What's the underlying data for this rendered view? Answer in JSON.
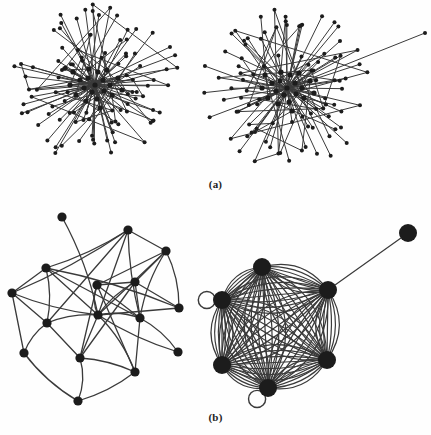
{
  "figure": {
    "background_color": "#fefefe",
    "edge_color": "#3a3a3a",
    "node_color": "#1c1c1c",
    "panels": [
      {
        "id": "a",
        "caption": "(a)",
        "description": "Two large star-like hub-and-spoke networks with many degree-one leaf nodes"
      },
      {
        "id": "b",
        "caption": "(b)",
        "description": "Left: sparse 14-node graph with one pendant node. Right: dense 6-node multigraph with parallel edges, two self-loops and one pendant node"
      }
    ]
  },
  "chart_data": {
    "type": "diagram",
    "subtype": "node-link-graph",
    "title": "",
    "graphs": [
      {
        "name": "panel-a-left",
        "panel": "a",
        "position": "left",
        "layout": "radial-hub",
        "node_count": 118,
        "hub_center": [
          95,
          85
        ],
        "hub_core_nodes": [
          [
            95,
            85
          ],
          [
            88,
            78
          ],
          [
            103,
            80
          ],
          [
            92,
            92
          ],
          [
            104,
            91
          ],
          [
            84,
            88
          ],
          [
            98,
            72
          ],
          [
            110,
            85
          ],
          [
            80,
            80
          ],
          [
            97,
            99
          ],
          [
            89,
            69
          ],
          [
            112,
            95
          ],
          [
            76,
            95
          ],
          [
            107,
            70
          ],
          [
            86,
            101
          ],
          [
            118,
            78
          ],
          [
            70,
            85
          ],
          [
            100,
            108
          ],
          [
            122,
            90
          ],
          [
            73,
            72
          ]
        ],
        "leaf_radius_min": 28,
        "leaf_radius_max": 88,
        "seed": 11,
        "node_radius_hub": 2.6,
        "node_radius_leaf": 2.0,
        "edge_width": 1.0
      },
      {
        "name": "panel-a-right",
        "panel": "a",
        "position": "right",
        "layout": "radial-hub",
        "node_count": 112,
        "hub_center": [
          287,
          88
        ],
        "hub_core_nodes": [
          [
            287,
            88
          ],
          [
            280,
            81
          ],
          [
            295,
            83
          ],
          [
            284,
            95
          ],
          [
            296,
            94
          ],
          [
            276,
            91
          ],
          [
            290,
            75
          ],
          [
            302,
            88
          ],
          [
            272,
            83
          ],
          [
            289,
            102
          ],
          [
            281,
            72
          ],
          [
            304,
            98
          ],
          [
            268,
            98
          ],
          [
            299,
            73
          ],
          [
            278,
            104
          ],
          [
            310,
            81
          ],
          [
            262,
            88
          ],
          [
            292,
            111
          ],
          [
            314,
            93
          ],
          [
            265,
            75
          ]
        ],
        "leaf_radius_min": 26,
        "leaf_radius_max": 86,
        "outlier_node": [
          425,
          33
        ],
        "outlier_note": "one long edge reaching far to the upper right",
        "seed": 29,
        "node_radius_hub": 2.6,
        "node_radius_leaf": 2.0,
        "edge_width": 1.0
      },
      {
        "name": "panel-b-left",
        "panel": "b",
        "position": "left",
        "layout": "force-directed",
        "node_count": 14,
        "edge_count": 40,
        "node_radius": 4.6,
        "edge_width": 1.3,
        "nodes": [
          {
            "id": 0,
            "x": 62,
            "y": 217,
            "label": "pendant-top"
          },
          {
            "id": 1,
            "x": 128,
            "y": 230,
            "label": "top-mid"
          },
          {
            "id": 2,
            "x": 166,
            "y": 251,
            "label": "top-right"
          },
          {
            "id": 3,
            "x": 46,
            "y": 268,
            "label": "upper-left"
          },
          {
            "id": 4,
            "x": 12,
            "y": 293,
            "label": "far-left"
          },
          {
            "id": 5,
            "x": 97,
            "y": 285,
            "label": "center-upper"
          },
          {
            "id": 6,
            "x": 135,
            "y": 282,
            "label": "center-right-upper"
          },
          {
            "id": 7,
            "x": 47,
            "y": 323,
            "label": "mid-left"
          },
          {
            "id": 8,
            "x": 98,
            "y": 315,
            "label": "center"
          },
          {
            "id": 9,
            "x": 140,
            "y": 318,
            "label": "center-right"
          },
          {
            "id": 10,
            "x": 179,
            "y": 308,
            "label": "right"
          },
          {
            "id": 11,
            "x": 24,
            "y": 353,
            "label": "lower-left"
          },
          {
            "id": 12,
            "x": 80,
            "y": 358,
            "label": "lower-center"
          },
          {
            "id": 13,
            "x": 78,
            "y": 401,
            "label": "bottom"
          },
          {
            "id": 14,
            "x": 135,
            "y": 372,
            "label": "lower-right"
          },
          {
            "id": 15,
            "x": 178,
            "y": 352,
            "label": "far-right-lower"
          }
        ],
        "edges": [
          [
            0,
            8
          ],
          [
            1,
            3
          ],
          [
            1,
            4
          ],
          [
            1,
            7
          ],
          [
            1,
            8
          ],
          [
            1,
            9
          ],
          [
            1,
            2
          ],
          [
            2,
            5
          ],
          [
            2,
            6
          ],
          [
            2,
            8
          ],
          [
            2,
            9
          ],
          [
            2,
            10
          ],
          [
            3,
            4
          ],
          [
            3,
            7
          ],
          [
            3,
            8
          ],
          [
            3,
            9
          ],
          [
            3,
            10
          ],
          [
            4,
            7
          ],
          [
            4,
            8
          ],
          [
            4,
            11
          ],
          [
            5,
            6
          ],
          [
            5,
            8
          ],
          [
            5,
            9
          ],
          [
            5,
            12
          ],
          [
            5,
            14
          ],
          [
            6,
            8
          ],
          [
            6,
            9
          ],
          [
            6,
            10
          ],
          [
            6,
            12
          ],
          [
            7,
            8
          ],
          [
            7,
            11
          ],
          [
            7,
            12
          ],
          [
            8,
            9
          ],
          [
            8,
            10
          ],
          [
            8,
            12
          ],
          [
            8,
            14
          ],
          [
            8,
            15
          ],
          [
            9,
            14
          ],
          [
            9,
            15
          ],
          [
            11,
            13
          ],
          [
            12,
            13
          ],
          [
            12,
            14
          ],
          [
            13,
            14
          ]
        ]
      },
      {
        "name": "panel-b-right",
        "panel": "b",
        "position": "right",
        "layout": "dense-multigraph",
        "node_count": 7,
        "node_radius": 9,
        "edge_width": 1.2,
        "has_self_loops": true,
        "self_loop_count": 2,
        "has_parallel_edges": true,
        "nodes": [
          {
            "id": 0,
            "x": 408,
            "y": 233,
            "label": "pendant"
          },
          {
            "id": 1,
            "x": 328,
            "y": 290,
            "label": "right-upper"
          },
          {
            "id": 2,
            "x": 262,
            "y": 267,
            "label": "top"
          },
          {
            "id": 3,
            "x": 222,
            "y": 300,
            "label": "left"
          },
          {
            "id": 4,
            "x": 222,
            "y": 365,
            "label": "lower-left"
          },
          {
            "id": 5,
            "x": 268,
            "y": 388,
            "label": "bottom"
          },
          {
            "id": 6,
            "x": 327,
            "y": 360,
            "label": "right-lower"
          }
        ],
        "edges": [
          [
            0,
            1
          ],
          [
            1,
            2
          ],
          [
            1,
            3
          ],
          [
            1,
            4
          ],
          [
            1,
            5
          ],
          [
            1,
            6
          ],
          [
            2,
            3
          ],
          [
            2,
            4
          ],
          [
            2,
            5
          ],
          [
            2,
            6
          ],
          [
            3,
            4
          ],
          [
            3,
            5
          ],
          [
            3,
            6
          ],
          [
            4,
            5
          ],
          [
            4,
            6
          ],
          [
            5,
            6
          ]
        ],
        "parallel_multiplicity": 7,
        "self_loops": [
          {
            "node": 3,
            "direction": "left"
          },
          {
            "node": 5,
            "direction": "bottom-left"
          }
        ]
      }
    ]
  }
}
